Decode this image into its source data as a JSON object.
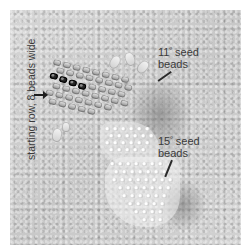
{
  "figure": {
    "labels": {
      "starting_row": "starting row, 8 beads wide",
      "seed_11_number": "11",
      "seed_11_text": " seed",
      "seed_11_text2": "beads",
      "seed_15_number": "15",
      "seed_15_text": " seed",
      "seed_15_text2": "beads",
      "degree_mark": "º"
    },
    "colors": {
      "background_margin": "#ffffff",
      "surface": "#cfcfcf",
      "label_text": "#3a3a3a",
      "dark_beads": "#151515",
      "light_beads": "#d8d8d8"
    }
  }
}
